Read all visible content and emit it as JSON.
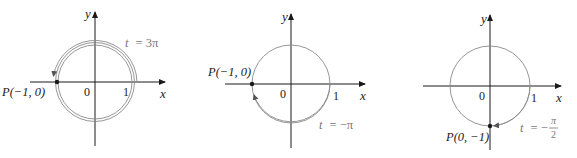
{
  "diagrams": [
    {
      "id": "panel-1",
      "axis_x_label": "x",
      "axis_y_label": "y",
      "origin_label": "0",
      "tick_one_label": "1",
      "point_label": "P(−1, 0)",
      "param_t": "t",
      "param_eq": "= 3π",
      "description": "Unit circle traversed counterclockwise multiple times ending at P(-1,0)"
    },
    {
      "id": "panel-2",
      "axis_x_label": "x",
      "axis_y_label": "y",
      "origin_label": "0",
      "tick_one_label": "1",
      "point_label": "P(−1, 0)",
      "param_t": "t",
      "param_eq": "= −π",
      "description": "Unit circle traversed clockwise half turn ending at P(-1,0)"
    },
    {
      "id": "panel-3",
      "axis_x_label": "x",
      "axis_y_label": "y",
      "origin_label": "0",
      "tick_one_label": "1",
      "point_label": "P(0, −1)",
      "param_t": "t",
      "param_eq_prefix": "= −",
      "param_frac_num": "π",
      "param_frac_den": "2",
      "description": "Unit circle traversed clockwise quarter turn ending at P(0,-1)"
    }
  ],
  "colors": {
    "axis": "#1a1a1a",
    "circle": "#8a8a8a",
    "point": "#1a1a1a",
    "param_text": "#777777"
  }
}
